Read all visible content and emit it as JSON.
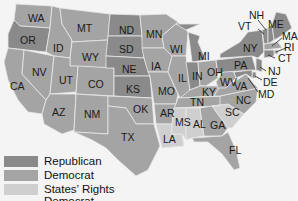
{
  "map": {
    "colors": {
      "republican": "#8a8a8a",
      "democrat": "#a4a4a4",
      "states_rights": "#cfcfcf",
      "background": "#f4f4f4"
    },
    "states": {
      "WA": {
        "label": "WA",
        "party": "democrat"
      },
      "OR": {
        "label": "OR",
        "party": "republican"
      },
      "CA": {
        "label": "CA",
        "party": "democrat"
      },
      "NV": {
        "label": "NV",
        "party": "democrat"
      },
      "ID": {
        "label": "ID",
        "party": "democrat"
      },
      "MT": {
        "label": "MT",
        "party": "democrat"
      },
      "WY": {
        "label": "WY",
        "party": "democrat"
      },
      "UT": {
        "label": "UT",
        "party": "democrat"
      },
      "CO": {
        "label": "CO",
        "party": "democrat"
      },
      "AZ": {
        "label": "AZ",
        "party": "democrat"
      },
      "NM": {
        "label": "NM",
        "party": "democrat"
      },
      "ND": {
        "label": "ND",
        "party": "republican"
      },
      "SD": {
        "label": "SD",
        "party": "republican"
      },
      "NE": {
        "label": "NE",
        "party": "republican"
      },
      "KS": {
        "label": "KS",
        "party": "republican"
      },
      "OK": {
        "label": "OK",
        "party": "democrat"
      },
      "TX": {
        "label": "TX",
        "party": "democrat"
      },
      "MN": {
        "label": "MN",
        "party": "democrat"
      },
      "IA": {
        "label": "IA",
        "party": "democrat"
      },
      "MO": {
        "label": "MO",
        "party": "democrat"
      },
      "AR": {
        "label": "AR",
        "party": "democrat"
      },
      "LA": {
        "label": "LA",
        "party": "states_rights"
      },
      "WI": {
        "label": "WI",
        "party": "democrat"
      },
      "IL": {
        "label": "IL",
        "party": "democrat"
      },
      "MI": {
        "label": "MI",
        "party": "republican"
      },
      "IN": {
        "label": "IN",
        "party": "republican"
      },
      "OH": {
        "label": "OH",
        "party": "democrat"
      },
      "KY": {
        "label": "KY",
        "party": "democrat"
      },
      "TN": {
        "label": "TN",
        "party": "democrat"
      },
      "MS": {
        "label": "MS",
        "party": "states_rights"
      },
      "AL": {
        "label": "AL",
        "party": "states_rights"
      },
      "GA": {
        "label": "GA",
        "party": "democrat"
      },
      "FL": {
        "label": "FL",
        "party": "democrat"
      },
      "SC": {
        "label": "SC",
        "party": "states_rights"
      },
      "NC": {
        "label": "NC",
        "party": "democrat"
      },
      "VA": {
        "label": "VA",
        "party": "democrat"
      },
      "WV": {
        "label": "WV",
        "party": "democrat"
      },
      "PA": {
        "label": "PA",
        "party": "republican"
      },
      "NY": {
        "label": "NY",
        "party": "republican"
      },
      "VT": {
        "label": "VT",
        "party": "republican"
      },
      "NH": {
        "label": "NH",
        "party": "republican"
      },
      "ME": {
        "label": "ME",
        "party": "republican"
      },
      "MA": {
        "label": "MA",
        "party": "democrat"
      },
      "RI": {
        "label": "RI",
        "party": "democrat"
      },
      "CT": {
        "label": "CT",
        "party": "republican"
      },
      "NJ": {
        "label": "NJ",
        "party": "republican"
      },
      "DE": {
        "label": "DE",
        "party": "republican"
      },
      "MD": {
        "label": "MD",
        "party": "republican"
      }
    }
  },
  "legend": {
    "items": [
      {
        "label": "Republican",
        "color": "#8a8a8a"
      },
      {
        "label": "Democrat",
        "color": "#a4a4a4"
      },
      {
        "label": "States’ Rights Democrat",
        "color": "#cfcfcf"
      }
    ]
  }
}
